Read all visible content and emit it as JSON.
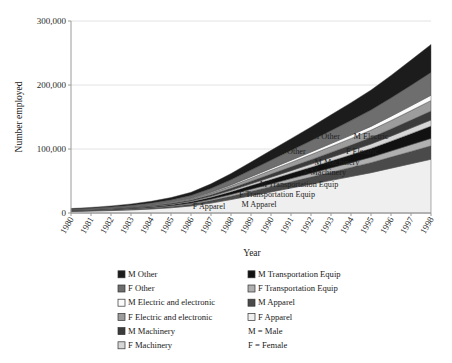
{
  "chart_data": {
    "type": "area",
    "stacked": true,
    "title": "",
    "xlabel": "Year",
    "ylabel": "Number employed",
    "grid": true,
    "legend_position": "bottom",
    "xlim": [
      1980,
      1998
    ],
    "ylim": [
      0,
      300000
    ],
    "yticks": [
      0,
      100000,
      200000,
      300000
    ],
    "ytick_labels": [
      "0",
      "100,000",
      "200,000",
      "300,000"
    ],
    "categories": [
      1980,
      1981,
      1982,
      1983,
      1984,
      1985,
      1986,
      1987,
      1988,
      1989,
      1990,
      1991,
      1992,
      1993,
      1994,
      1995,
      1996,
      1997,
      1998
    ],
    "xtick_labels": [
      "1980",
      "1981",
      "1982",
      "1983",
      "1984",
      "1985",
      "1986",
      "1987",
      "1988",
      "1989",
      "1990",
      "1991",
      "1992",
      "1993",
      "1994",
      "1995",
      "1996",
      "1997",
      "1998"
    ],
    "series": [
      {
        "name": "F Apparel",
        "color": "#efefef",
        "values": [
          2400,
          3000,
          3800,
          4800,
          6200,
          8200,
          11000,
          15500,
          21000,
          27000,
          33000,
          39000,
          45000,
          51000,
          57000,
          63000,
          70000,
          77000,
          84000
        ]
      },
      {
        "name": "M Apparel",
        "color": "#4a4a4a",
        "values": [
          600,
          750,
          950,
          1200,
          1550,
          2050,
          2750,
          3900,
          5200,
          6700,
          8200,
          9700,
          11200,
          12700,
          14200,
          15700,
          17400,
          19200,
          21000
        ]
      },
      {
        "name": "F Transportation Equip",
        "color": "#b0b0b0",
        "values": [
          300,
          380,
          480,
          620,
          800,
          1050,
          1400,
          2000,
          2700,
          3500,
          4300,
          5100,
          5900,
          6700,
          7500,
          8400,
          9400,
          10500,
          11600
        ]
      },
      {
        "name": "M Transportation Equip",
        "color": "#111111",
        "values": [
          500,
          620,
          780,
          1000,
          1300,
          1700,
          2300,
          3200,
          4300,
          5600,
          6900,
          8200,
          9500,
          10900,
          12300,
          13800,
          15500,
          17300,
          19200
        ]
      },
      {
        "name": "F Machinery",
        "color": "#d6d6d6",
        "values": [
          250,
          310,
          390,
          500,
          650,
          860,
          1150,
          1600,
          2200,
          2850,
          3500,
          4150,
          4800,
          5500,
          6200,
          6950,
          7800,
          8700,
          9600
        ]
      },
      {
        "name": "M Machinery",
        "color": "#3b3b3b",
        "values": [
          350,
          440,
          560,
          720,
          930,
          1230,
          1650,
          2300,
          3100,
          4050,
          5000,
          5950,
          6900,
          7900,
          8900,
          9950,
          11200,
          12500,
          13900
        ]
      },
      {
        "name": "F Electric and electronic",
        "color": "#9c9c9c",
        "values": [
          400,
          500,
          640,
          820,
          1060,
          1400,
          1880,
          2650,
          3600,
          4700,
          5800,
          6900,
          8000,
          9200,
          10400,
          11700,
          13200,
          14800,
          16500
        ]
      },
      {
        "name": "M Electric and electronic",
        "color": "#fbfbfb",
        "values": [
          200,
          250,
          320,
          410,
          530,
          700,
          940,
          1320,
          1800,
          2350,
          2900,
          3450,
          4000,
          4600,
          5200,
          5850,
          6600,
          7400,
          8200
        ]
      },
      {
        "name": "F Other",
        "color": "#6e6e6e",
        "values": [
          900,
          1120,
          1420,
          1820,
          2350,
          3100,
          4150,
          5850,
          7900,
          10300,
          12700,
          15100,
          17500,
          20100,
          22700,
          25400,
          28600,
          32000,
          35500
        ]
      },
      {
        "name": "M Other",
        "color": "#1c1c1c",
        "values": [
          1100,
          1380,
          1750,
          2250,
          2900,
          3820,
          5120,
          7200,
          9750,
          12700,
          15600,
          18600,
          21600,
          24800,
          28000,
          31300,
          35300,
          39500,
          43900
        ]
      }
    ],
    "plot_annotations": [
      {
        "text": "M Other",
        "x": 326,
        "y": 139
      },
      {
        "text": "M Electric",
        "x": 371,
        "y": 139
      },
      {
        "text": "F Other",
        "x": 293,
        "y": 154
      },
      {
        "text": "F Electric",
        "x": 362,
        "y": 154
      },
      {
        "text": "M Machinery",
        "x": 337,
        "y": 165
      },
      {
        "text": "F Machinery",
        "x": 325,
        "y": 175
      },
      {
        "text": "M Transportation Equip",
        "x": 299,
        "y": 187
      },
      {
        "text": "F Transportation Equip",
        "x": 277,
        "y": 197
      },
      {
        "text": "F Apparel",
        "x": 209,
        "y": 209
      },
      {
        "text": "M Apparel",
        "x": 259,
        "y": 207
      }
    ]
  },
  "legend": {
    "columns": [
      {
        "entries": [
          {
            "label": "M Other",
            "color": "#1c1c1c"
          },
          {
            "label": "F Other",
            "color": "#6e6e6e"
          },
          {
            "label": "M Electric and electronic",
            "color": "#fbfbfb"
          },
          {
            "label": "F Electric and electronic",
            "color": "#9c9c9c"
          },
          {
            "label": "M Machinery",
            "color": "#3b3b3b"
          },
          {
            "label": "F Machinery",
            "color": "#d6d6d6"
          }
        ]
      },
      {
        "entries": [
          {
            "label": "M Transportation Equip",
            "color": "#111111"
          },
          {
            "label": "F Transportation Equip",
            "color": "#b0b0b0"
          },
          {
            "label": "M Apparel",
            "color": "#4a4a4a"
          },
          {
            "label": "F Apparel",
            "color": "#efefef"
          }
        ],
        "notes": [
          "M = Male",
          "F = Female"
        ]
      }
    ]
  }
}
